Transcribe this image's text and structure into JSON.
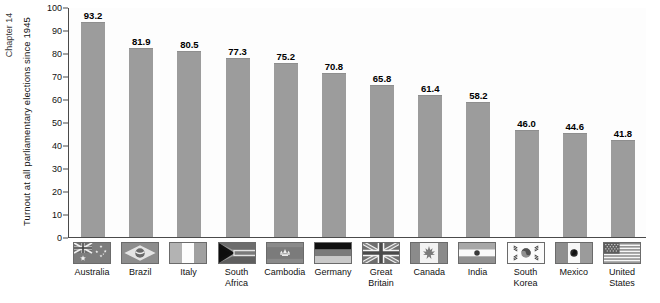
{
  "page": {
    "chapter_tag": "Chapter 14"
  },
  "chart_data": {
    "type": "bar",
    "title": "",
    "xlabel": "",
    "ylabel": "Turnout at all parliamentary elections since 1945",
    "ylim": [
      0,
      100
    ],
    "ytick_labels": [
      "0",
      "10",
      "20",
      "30",
      "40",
      "50",
      "60",
      "70",
      "80",
      "90",
      "100"
    ],
    "ytick_values": [
      0,
      10,
      20,
      30,
      40,
      50,
      60,
      70,
      80,
      90,
      100
    ],
    "grid": false,
    "legend": "none",
    "bar_color": "#9c9c9c",
    "categories": [
      "Australia",
      "Brazil",
      "Italy",
      "South\nAfrica",
      "Cambodia",
      "Germany",
      "Great\nBritain",
      "Canada",
      "India",
      "South\nKorea",
      "Mexico",
      "United\nStates"
    ],
    "values": [
      93.2,
      81.9,
      80.5,
      77.3,
      75.2,
      70.8,
      65.8,
      61.4,
      58.2,
      46.0,
      44.6,
      41.8
    ],
    "value_labels": [
      "93.2",
      "81.9",
      "80.5",
      "77.3",
      "75.2",
      "70.8",
      "65.8",
      "61.4",
      "58.2",
      "46.0",
      "44.6",
      "41.8"
    ],
    "flag_icons": [
      "flag-australia-icon",
      "flag-brazil-icon",
      "flag-italy-icon",
      "flag-south-africa-icon",
      "flag-cambodia-icon",
      "flag-germany-icon",
      "flag-great-britain-icon",
      "flag-canada-icon",
      "flag-india-icon",
      "flag-south-korea-icon",
      "flag-mexico-icon",
      "flag-united-states-icon"
    ]
  }
}
